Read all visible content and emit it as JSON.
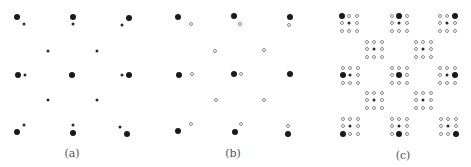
{
  "figure": {
    "panels": [
      {
        "id": "a",
        "label": "(a)",
        "label_pos": [
          72,
          147
        ],
        "points": [
          {
            "x": 17,
            "y": 17,
            "type": "large"
          },
          {
            "x": 24,
            "y": 24,
            "type": "small"
          },
          {
            "x": 73,
            "y": 17,
            "type": "large"
          },
          {
            "x": 73,
            "y": 24,
            "type": "small"
          },
          {
            "x": 129,
            "y": 18,
            "type": "large"
          },
          {
            "x": 122,
            "y": 25,
            "type": "small"
          },
          {
            "x": 48,
            "y": 51,
            "type": "small"
          },
          {
            "x": 97,
            "y": 51,
            "type": "small"
          },
          {
            "x": 18,
            "y": 75,
            "type": "large"
          },
          {
            "x": 25,
            "y": 75,
            "type": "small"
          },
          {
            "x": 72,
            "y": 75,
            "type": "large"
          },
          {
            "x": 122,
            "y": 75,
            "type": "small"
          },
          {
            "x": 129,
            "y": 75,
            "type": "large"
          },
          {
            "x": 48,
            "y": 100,
            "type": "small"
          },
          {
            "x": 97,
            "y": 100,
            "type": "small"
          },
          {
            "x": 24,
            "y": 125,
            "type": "small"
          },
          {
            "x": 17,
            "y": 132,
            "type": "large"
          },
          {
            "x": 73,
            "y": 125,
            "type": "small"
          },
          {
            "x": 73,
            "y": 133,
            "type": "large"
          },
          {
            "x": 120,
            "y": 127,
            "type": "small"
          },
          {
            "x": 127,
            "y": 134,
            "type": "large"
          }
        ]
      },
      {
        "id": "b",
        "label": "(b)",
        "label_pos": [
          233,
          147
        ],
        "points": [
          {
            "x": 178,
            "y": 17,
            "type": "large"
          },
          {
            "x": 191,
            "y": 24,
            "type": "open"
          },
          {
            "x": 234,
            "y": 16,
            "type": "large"
          },
          {
            "x": 240,
            "y": 24,
            "type": "open"
          },
          {
            "x": 290,
            "y": 17,
            "type": "large"
          },
          {
            "x": 289,
            "y": 25,
            "type": "open"
          },
          {
            "x": 215,
            "y": 51,
            "type": "open"
          },
          {
            "x": 264,
            "y": 50,
            "type": "open"
          },
          {
            "x": 179,
            "y": 75,
            "type": "large"
          },
          {
            "x": 192,
            "y": 74,
            "type": "open"
          },
          {
            "x": 234,
            "y": 74,
            "type": "large"
          },
          {
            "x": 241,
            "y": 74,
            "type": "open"
          },
          {
            "x": 290,
            "y": 74,
            "type": "large"
          },
          {
            "x": 216,
            "y": 100,
            "type": "open"
          },
          {
            "x": 264,
            "y": 100,
            "type": "open"
          },
          {
            "x": 191,
            "y": 124,
            "type": "open"
          },
          {
            "x": 178,
            "y": 131,
            "type": "large"
          },
          {
            "x": 241,
            "y": 124,
            "type": "open"
          },
          {
            "x": 235,
            "y": 132,
            "type": "large"
          },
          {
            "x": 288,
            "y": 126,
            "type": "open"
          },
          {
            "x": 288,
            "y": 134,
            "type": "large"
          }
        ]
      },
      {
        "id": "c",
        "label": "(c)",
        "label_pos": [
          403,
          149
        ],
        "spacing": 7.5,
        "groups": [
          {
            "cx": 349,
            "cy": 23,
            "big": [
              0,
              0
            ]
          },
          {
            "cx": 399,
            "cy": 23,
            "big": [
              1,
              0
            ]
          },
          {
            "cx": 447,
            "cy": 23,
            "big": [
              2,
              0
            ]
          },
          {
            "cx": 374,
            "cy": 49,
            "big": null
          },
          {
            "cx": 423,
            "cy": 49,
            "big": null
          },
          {
            "cx": 350,
            "cy": 75,
            "big": [
              0,
              1
            ]
          },
          {
            "cx": 399,
            "cy": 75,
            "big": [
              1,
              1
            ]
          },
          {
            "cx": 447,
            "cy": 75,
            "big": [
              2,
              1
            ]
          },
          {
            "cx": 374,
            "cy": 100,
            "big": null
          },
          {
            "cx": 423,
            "cy": 100,
            "big": null
          },
          {
            "cx": 350,
            "cy": 126,
            "big": [
              0,
              2
            ]
          },
          {
            "cx": 399,
            "cy": 126,
            "big": [
              1,
              2
            ]
          },
          {
            "cx": 448,
            "cy": 126,
            "big": [
              2,
              2
            ]
          }
        ]
      }
    ]
  },
  "colors": {
    "filled": "#1a1a1a",
    "open_border": "#8a8a8a",
    "label": "#555555",
    "background": "#ffffff"
  }
}
